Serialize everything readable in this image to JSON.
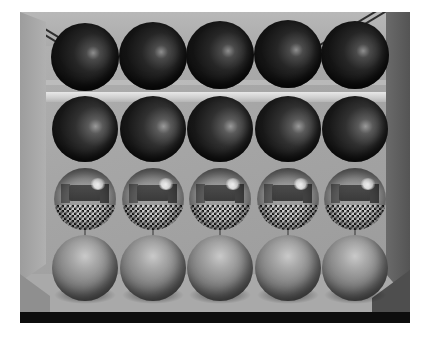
{
  "render": {
    "title": "Ray-traced sphere grid in a room",
    "canvas": {
      "width": 427,
      "height": 338,
      "background": "#ffffff"
    },
    "scene": {
      "x": 20,
      "y": 12,
      "width": 390,
      "height": 311
    }
  },
  "environment": {
    "back_wall": {
      "name": "back-wall",
      "color": "#a6a6a6"
    },
    "left_wall": {
      "name": "left-wall",
      "color": "#a5a5a5"
    },
    "right_wall": {
      "name": "right-wall",
      "color": "#5e5e5e"
    },
    "ceiling": {
      "name": "ceiling",
      "color": "#b0b0b0"
    },
    "molding_lines": {
      "count": 4,
      "color": "#2e2e2e"
    },
    "back_band": {
      "name": "wall-molding-band",
      "color": "#d8d8d8"
    },
    "floor": {
      "name": "checkerboard-floor",
      "pattern": "checker",
      "light_color": "#f2f2f2",
      "dark_color": "#111111",
      "front_edge_color": "#0d0d0d"
    }
  },
  "grid": {
    "columns": 5,
    "rows": 4,
    "column_centers": [
      85,
      153,
      220,
      288,
      355
    ],
    "rows_info": [
      {
        "index": 1,
        "material": "dark-matte-specular",
        "cy": 57,
        "r": 34,
        "color": "#1a1a1a"
      },
      {
        "index": 2,
        "material": "dark-matte-specular",
        "cy": 129,
        "r": 33,
        "color": "#202020"
      },
      {
        "index": 3,
        "material": "chrome-mirror",
        "cy": 199,
        "r": 31,
        "color": "#8d8d8d"
      },
      {
        "index": 4,
        "material": "gray-matte",
        "cy": 268,
        "r": 33,
        "color": "#8a8a8a"
      }
    ]
  },
  "spheres": [
    {
      "id": "sphere-r1c1",
      "row": 1,
      "col": 1,
      "cx": 85,
      "cy": 57,
      "r": 34,
      "material": "dark-matte-specular"
    },
    {
      "id": "sphere-r1c2",
      "row": 1,
      "col": 2,
      "cx": 153,
      "cy": 56,
      "r": 34,
      "material": "dark-matte-specular"
    },
    {
      "id": "sphere-r1c3",
      "row": 1,
      "col": 3,
      "cx": 220,
      "cy": 55,
      "r": 34,
      "material": "dark-matte-specular"
    },
    {
      "id": "sphere-r1c4",
      "row": 1,
      "col": 4,
      "cx": 288,
      "cy": 54,
      "r": 34,
      "material": "dark-matte-specular"
    },
    {
      "id": "sphere-r1c5",
      "row": 1,
      "col": 5,
      "cx": 355,
      "cy": 55,
      "r": 34,
      "material": "dark-matte-specular"
    },
    {
      "id": "sphere-r2c1",
      "row": 2,
      "col": 1,
      "cx": 85,
      "cy": 129,
      "r": 33,
      "material": "dark-matte-specular"
    },
    {
      "id": "sphere-r2c2",
      "row": 2,
      "col": 2,
      "cx": 153,
      "cy": 129,
      "r": 33,
      "material": "dark-matte-specular"
    },
    {
      "id": "sphere-r2c3",
      "row": 2,
      "col": 3,
      "cx": 220,
      "cy": 129,
      "r": 33,
      "material": "dark-matte-specular"
    },
    {
      "id": "sphere-r2c4",
      "row": 2,
      "col": 4,
      "cx": 288,
      "cy": 129,
      "r": 33,
      "material": "dark-matte-specular"
    },
    {
      "id": "sphere-r2c5",
      "row": 2,
      "col": 5,
      "cx": 355,
      "cy": 129,
      "r": 33,
      "material": "dark-matte-specular"
    },
    {
      "id": "sphere-r3c1",
      "row": 3,
      "col": 1,
      "cx": 85,
      "cy": 199,
      "r": 31,
      "material": "chrome-mirror"
    },
    {
      "id": "sphere-r3c2",
      "row": 3,
      "col": 2,
      "cx": 153,
      "cy": 199,
      "r": 31,
      "material": "chrome-mirror"
    },
    {
      "id": "sphere-r3c3",
      "row": 3,
      "col": 3,
      "cx": 220,
      "cy": 199,
      "r": 31,
      "material": "chrome-mirror"
    },
    {
      "id": "sphere-r3c4",
      "row": 3,
      "col": 4,
      "cx": 288,
      "cy": 199,
      "r": 31,
      "material": "chrome-mirror"
    },
    {
      "id": "sphere-r3c5",
      "row": 3,
      "col": 5,
      "cx": 355,
      "cy": 199,
      "r": 31,
      "material": "chrome-mirror"
    },
    {
      "id": "sphere-r4c1",
      "row": 4,
      "col": 1,
      "cx": 85,
      "cy": 268,
      "r": 33,
      "material": "gray-matte"
    },
    {
      "id": "sphere-r4c2",
      "row": 4,
      "col": 2,
      "cx": 153,
      "cy": 268,
      "r": 33,
      "material": "gray-matte"
    },
    {
      "id": "sphere-r4c3",
      "row": 4,
      "col": 3,
      "cx": 220,
      "cy": 268,
      "r": 33,
      "material": "gray-matte"
    },
    {
      "id": "sphere-r4c4",
      "row": 4,
      "col": 4,
      "cx": 288,
      "cy": 268,
      "r": 33,
      "material": "gray-matte"
    },
    {
      "id": "sphere-r4c5",
      "row": 4,
      "col": 5,
      "cx": 355,
      "cy": 268,
      "r": 33,
      "material": "gray-matte"
    }
  ]
}
